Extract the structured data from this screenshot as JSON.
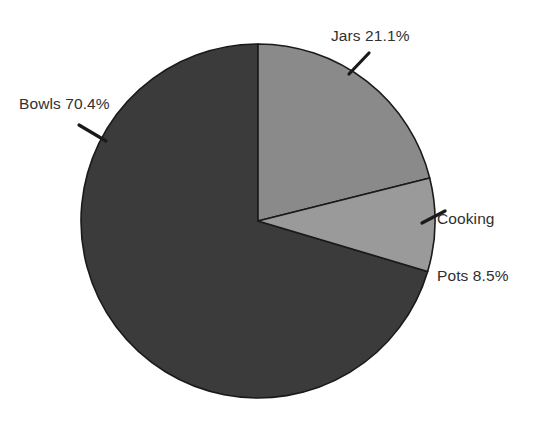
{
  "chart_data": {
    "type": "pie",
    "title": "",
    "subtitle": "",
    "xlabel": "",
    "ylabel": "",
    "legend_position": "none",
    "grid": false,
    "start_angle_deg": 90,
    "direction": "clockwise",
    "value_unit": "percent",
    "categories": [
      "Jars",
      "Cooking Pots",
      "Bowls"
    ],
    "values": [
      21.1,
      8.5,
      70.4
    ],
    "slices": [
      {
        "name": "Jars",
        "value": 21.1,
        "label": "Jars 21.1%",
        "label_lines": [
          "Jars 21.1%"
        ],
        "color": "#8a8a8a",
        "angle_deg": 75.96
      },
      {
        "name": "Cooking Pots",
        "value": 8.5,
        "label": "Cooking Pots 8.5%",
        "label_lines": [
          "Cooking",
          "Pots 8.5%"
        ],
        "color": "#9a9a9a",
        "angle_deg": 30.6
      },
      {
        "name": "Bowls",
        "value": 70.4,
        "label": "Bowls 70.4%",
        "label_lines": [
          "Bowls 70.4%"
        ],
        "color": "#3b3b3b",
        "angle_deg": 253.44
      }
    ],
    "colors": {
      "jars": "#8a8a8a",
      "cooking_pots": "#9a9a9a",
      "bowls": "#3b3b3b",
      "slice_outline": "#1a1a1a",
      "label_text": "#303030",
      "leader_line": "#1a1a1a",
      "background": "#ffffff"
    },
    "geometry": {
      "center_x": 258,
      "center_y": 221,
      "radius": 177
    }
  },
  "labels": {
    "jars": "Jars 21.1%",
    "bowls": "Bowls 70.4%",
    "cooking_pots_line1": "Cooking",
    "cooking_pots_line2": "Pots 8.5%"
  }
}
